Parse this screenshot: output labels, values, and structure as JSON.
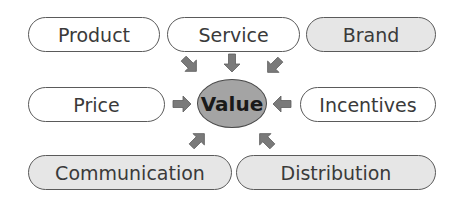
{
  "diagram": {
    "center": {
      "label": "Value"
    },
    "nodes": [
      {
        "id": "product",
        "label": "Product",
        "filled": false
      },
      {
        "id": "service",
        "label": "Service",
        "filled": false
      },
      {
        "id": "brand",
        "label": "Brand",
        "filled": true
      },
      {
        "id": "price",
        "label": "Price",
        "filled": false
      },
      {
        "id": "incentives",
        "label": "Incentives",
        "filled": false
      },
      {
        "id": "communication",
        "label": "Communication",
        "filled": true
      },
      {
        "id": "distribution",
        "label": "Distribution",
        "filled": true
      }
    ],
    "colors": {
      "center_fill": "#a4a4a4",
      "filled_pill": "#e6e6e6",
      "arrow": "#7a7a7a",
      "border": "#5a5a5a"
    }
  }
}
